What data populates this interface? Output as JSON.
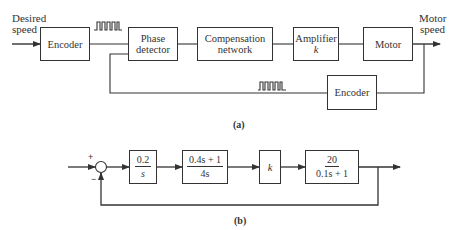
{
  "diagram_a": {
    "caption": "(a)",
    "input_label": [
      "Desired",
      "speed"
    ],
    "output_label": [
      "Motor",
      "speed"
    ],
    "blocks": {
      "encoder_forward": "Encoder",
      "phase_detector": [
        "Phase",
        "detector"
      ],
      "compensation_network": [
        "Compensation",
        "network"
      ],
      "amplifier": [
        "Amplifier",
        "k"
      ],
      "motor": "Motor",
      "encoder_feedback": "Encoder"
    },
    "signals": [
      "pulse-train-forward",
      "pulse-train-feedback"
    ]
  },
  "diagram_b": {
    "caption": "(b)",
    "summing_junction": {
      "plus": "+",
      "minus": "−"
    },
    "blocks": {
      "integrator": {
        "num": "0.2",
        "den": "s"
      },
      "compensator": {
        "num": "0.4s + 1",
        "den": "4s"
      },
      "gain": "k",
      "plant": {
        "num": "20",
        "den": "0.1s + 1"
      }
    },
    "feedback": "unity negative feedback"
  },
  "colors": {
    "line": "#333333",
    "background": "#ffffff"
  }
}
